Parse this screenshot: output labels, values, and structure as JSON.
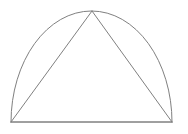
{
  "figure": {
    "title": "Triangle inscribed in a semicircular arc",
    "canvas": {
      "width": 188,
      "height": 134,
      "background_color": "#ffffff"
    },
    "style": {
      "stroke_color": "#808080",
      "stroke_width": 1,
      "fill": "none"
    },
    "points": {
      "left_base": {
        "label": "A",
        "x": 11,
        "y": 122
      },
      "right_base": {
        "label": "B",
        "x": 172,
        "y": 122
      },
      "apex": {
        "label": "C",
        "x": 92,
        "y": 11
      }
    },
    "arc": {
      "name": "dome-arc",
      "type": "elliptical-arc",
      "start_x": 11,
      "start_y": 122,
      "end_x": 172,
      "end_y": 122,
      "rx": 80.5,
      "ry": 111,
      "x_axis_rotation": 0,
      "large_arc_flag": 0,
      "sweep_flag": 1,
      "path": "M 11 122 A 80.5 111 0 0 1 172 122"
    },
    "baseline": {
      "name": "base-chord",
      "x1": 11,
      "y1": 122,
      "x2": 172,
      "y2": 122,
      "length": 161
    },
    "triangle": {
      "name": "inscribed-triangle",
      "points": "11,122 92,11 172,122",
      "left_side": {
        "x1": 11,
        "y1": 122,
        "x2": 92,
        "y2": 11
      },
      "right_side": {
        "x1": 92,
        "y1": 11,
        "x2": 172,
        "y2": 122
      },
      "base": {
        "x1": 11,
        "y1": 122,
        "x2": 172,
        "y2": 122
      },
      "base_length": 161,
      "height": 111
    },
    "caption": ""
  }
}
